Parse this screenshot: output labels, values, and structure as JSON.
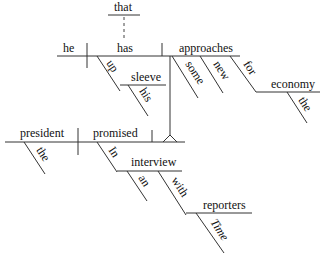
{
  "diagram": {
    "type": "reed-kellogg-sentence-diagram",
    "sentence_words": {
      "that": "that",
      "he": "he",
      "has": "has",
      "up": "up",
      "sleeve": "sleeve",
      "his": "his",
      "approaches": "approaches",
      "some": "some",
      "new": "new",
      "for": "for",
      "economy": "economy",
      "the_economy": "the",
      "president": "president",
      "the_president": "the",
      "promised": "promised",
      "in": "In",
      "interview": "interview",
      "an": "an",
      "with": "with",
      "reporters": "reporters",
      "time": "Time"
    },
    "colors": {
      "line": "#333333",
      "text": "#111111",
      "background": "#ffffff"
    }
  }
}
